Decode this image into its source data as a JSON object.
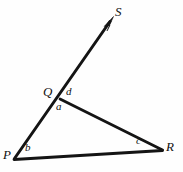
{
  "figure": {
    "type": "geometry-diagram",
    "width": 183,
    "height": 172,
    "background_color": "#fefefe",
    "stroke_color": "#141414",
    "points": {
      "P": {
        "label": "P",
        "x": 14,
        "y": 158,
        "label_x": 3,
        "label_y": 148
      },
      "Q": {
        "label": "Q",
        "x": 59,
        "y": 98,
        "label_x": 43,
        "label_y": 85
      },
      "R": {
        "label": "R",
        "x": 162,
        "y": 150,
        "label_x": 166,
        "label_y": 140
      },
      "S": {
        "label": "S",
        "x": 113,
        "y": 22,
        "label_x": 115,
        "label_y": 5
      }
    },
    "segments": [
      {
        "name": "ray-PS",
        "from": "P",
        "to": "S",
        "arrow": true
      },
      {
        "name": "segment-QR",
        "from": "Q",
        "to": "R",
        "arrow": false
      },
      {
        "name": "segment-PR",
        "from": "P",
        "to": "R",
        "arrow": false
      }
    ],
    "angles": [
      {
        "name": "angle-a",
        "label": "a",
        "at": "Q",
        "x": 56,
        "y": 101
      },
      {
        "name": "angle-b",
        "label": "b",
        "at": "P",
        "x": 25,
        "y": 142
      },
      {
        "name": "angle-c",
        "label": "c",
        "at": "R",
        "x": 136,
        "y": 135
      },
      {
        "name": "angle-d",
        "label": "d",
        "at": "Q",
        "x": 66,
        "y": 86
      }
    ]
  }
}
